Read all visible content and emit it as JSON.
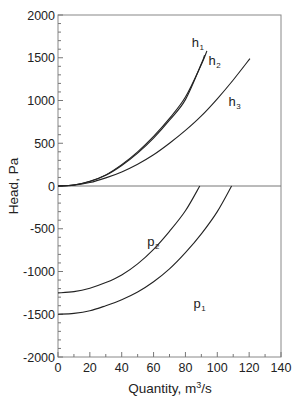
{
  "chart_data": {
    "type": "line",
    "title": "",
    "xlabel": "Quantity, m³/s",
    "xlabel_main": "Quantity, m",
    "xlabel_sup": "3",
    "xlabel_tail": "/s",
    "ylabel": "Head, Pa",
    "xlim": [
      0,
      140
    ],
    "ylim": [
      -2000,
      2000
    ],
    "x_ticks": [
      0,
      20,
      40,
      60,
      80,
      100,
      120,
      140
    ],
    "y_ticks": [
      2000,
      1500,
      1000,
      500,
      0,
      -500,
      -1000,
      -1500,
      -2000
    ],
    "x_minor_step": 10,
    "y_minor_step": 100,
    "grid": false,
    "legend": "none (inline curve labels)",
    "series": [
      {
        "name": "h1",
        "label_main": "h",
        "label_sub": "1",
        "x": [
          0,
          10,
          20,
          30,
          40,
          50,
          60,
          70,
          80,
          90,
          93.5
        ],
        "y": [
          0,
          12,
          55,
          130,
          250,
          400,
          580,
          790,
          1040,
          1420,
          1580
        ]
      },
      {
        "name": "h2",
        "label_main": "h",
        "label_sub": "2",
        "x": [
          0,
          10,
          20,
          30,
          40,
          50,
          60,
          70,
          80,
          90,
          92
        ],
        "y": [
          0,
          12,
          52,
          125,
          240,
          385,
          560,
          770,
          1010,
          1430,
          1530
        ]
      },
      {
        "name": "h3",
        "label_main": "h",
        "label_sub": "3",
        "x": [
          0,
          10,
          20,
          30,
          40,
          50,
          60,
          70,
          80,
          90,
          100,
          110,
          120.5
        ],
        "y": [
          0,
          10,
          40,
          95,
          165,
          255,
          365,
          500,
          650,
          820,
          1020,
          1240,
          1490
        ]
      },
      {
        "name": "p1",
        "label_main": "p",
        "label_sub": "1",
        "x": [
          0,
          10,
          20,
          30,
          40,
          50,
          60,
          70,
          80,
          90,
          100,
          109
        ],
        "y": [
          -1500,
          -1490,
          -1460,
          -1400,
          -1330,
          -1240,
          -1120,
          -970,
          -780,
          -560,
          -300,
          0
        ]
      },
      {
        "name": "p2",
        "label_main": "p",
        "label_sub": "2",
        "x": [
          0,
          10,
          20,
          30,
          40,
          50,
          60,
          70,
          80,
          89
        ],
        "y": [
          -1250,
          -1235,
          -1195,
          -1130,
          -1040,
          -910,
          -740,
          -530,
          -290,
          0
        ]
      }
    ]
  }
}
